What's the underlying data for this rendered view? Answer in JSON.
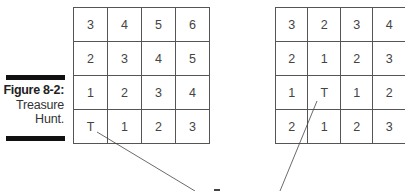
{
  "figure": {
    "label": "Figure 8-2:",
    "title_line1": "Treasure",
    "title_line2": "Hunt."
  },
  "grids": {
    "left": {
      "rows": [
        [
          "3",
          "4",
          "5",
          "6"
        ],
        [
          "2",
          "3",
          "4",
          "5"
        ],
        [
          "1",
          "2",
          "3",
          "4"
        ],
        [
          "T",
          "1",
          "2",
          "3"
        ]
      ]
    },
    "right": {
      "rows": [
        [
          "3",
          "2",
          "3",
          "4"
        ],
        [
          "2",
          "1",
          "2",
          "3"
        ],
        [
          "1",
          "T",
          "1",
          "2"
        ],
        [
          "2",
          "1",
          "2",
          "3"
        ]
      ]
    }
  },
  "colors": {
    "bar": "#111111",
    "grid_line": "#555555",
    "text": "#444444"
  }
}
